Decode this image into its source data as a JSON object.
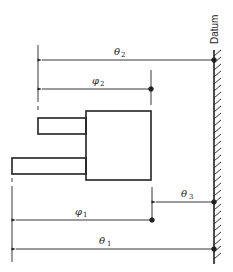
{
  "datum_label": "Datum",
  "dimensions": [
    {
      "id": "theta2",
      "symbol": "θ",
      "subscript": "2",
      "from": "datum",
      "to": "left end of small upper shaft"
    },
    {
      "id": "phi2",
      "symbol": "φ",
      "subscript": "2",
      "from": "right face of body",
      "to": "left end of small upper shaft"
    },
    {
      "id": "theta3",
      "symbol": "θ",
      "subscript": "3",
      "from": "datum",
      "to": "right face of body"
    },
    {
      "id": "phi1",
      "symbol": "φ",
      "subscript": "1",
      "from": "right face of body",
      "to": "left end of long lower shaft"
    },
    {
      "id": "theta1",
      "symbol": "θ",
      "subscript": "1",
      "from": "datum",
      "to": "left end of long lower shaft"
    }
  ],
  "colors": {
    "line": "#222222",
    "background": "#ffffff"
  }
}
